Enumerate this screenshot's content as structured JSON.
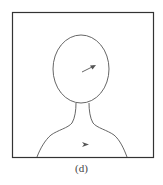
{
  "figure": {
    "caption": "(d)",
    "frame": {
      "x": 12,
      "y": 12,
      "width": 141,
      "height": 145,
      "stroke": "#333333"
    },
    "head": {
      "cx": 81,
      "cy": 69,
      "rx": 28,
      "ry": 34,
      "stroke": "#555555"
    },
    "body_outline_color": "#555555",
    "arrows": [
      {
        "name": "head-arrow",
        "direction": "up-right",
        "color": "#555555"
      },
      {
        "name": "chest-arrowhead",
        "direction": "right",
        "color": "#555555"
      }
    ]
  }
}
